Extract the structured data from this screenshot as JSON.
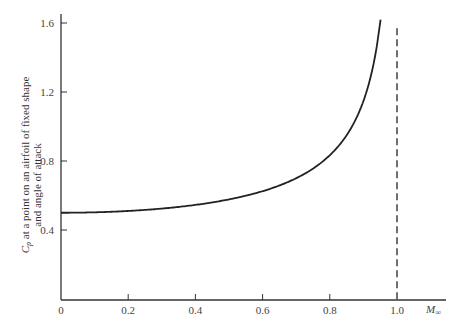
{
  "chart_data": {
    "type": "line",
    "title": "",
    "xlabel": "M∞",
    "ylabel_line1": "C_p at a point on an airfoil of fixed shape",
    "ylabel_line2": "and angle of attack",
    "xlim": [
      0,
      1.1
    ],
    "ylim": [
      0,
      1.65
    ],
    "xticks": [
      "0",
      "0.2",
      "0.4",
      "0.6",
      "0.8",
      "1.0"
    ],
    "xtick_values": [
      0,
      0.2,
      0.4,
      0.6,
      0.8,
      1.0
    ],
    "yticks": [
      "0.4",
      "0.8",
      "1.2",
      "1.6"
    ],
    "ytick_values": [
      0.4,
      0.8,
      1.2,
      1.6
    ],
    "grid": false,
    "series": [
      {
        "name": "Cp (compressible)",
        "style": "solid",
        "x": [
          0,
          0.1,
          0.2,
          0.3,
          0.4,
          0.5,
          0.6,
          0.7,
          0.75,
          0.8,
          0.85,
          0.88,
          0.9,
          0.92,
          0.94
        ],
        "y": [
          0.5,
          0.503,
          0.51,
          0.524,
          0.546,
          0.577,
          0.625,
          0.7,
          0.756,
          0.833,
          0.949,
          1.053,
          1.147,
          1.276,
          1.466
        ]
      }
    ],
    "annotations": [
      {
        "type": "vertical-dashed-line",
        "x": 1.0,
        "y_top": 1.57
      }
    ]
  }
}
